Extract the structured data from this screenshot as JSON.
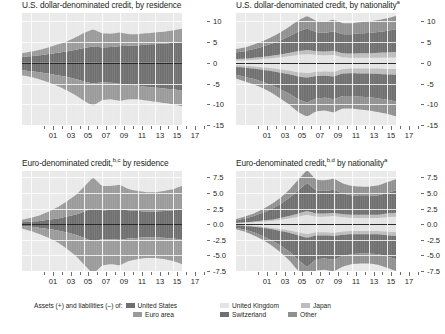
{
  "figure": {
    "panels": [
      {
        "id": "usd-by-residence",
        "title_main": "U.S. dollar-denominated credit, by residence",
        "title_pre": "U.S. dollar-denominated credit, by residence",
        "title_sup": "",
        "yticks": [
          "10",
          "5",
          "0",
          "-5",
          "-10",
          "-15"
        ],
        "xticks": [
          "01",
          "03",
          "05",
          "07",
          "09",
          "11",
          "13",
          "15",
          "17"
        ]
      },
      {
        "id": "usd-by-nationality",
        "title_main": "U.S. dollar-denominated credit, by nationality",
        "title_pre": "U.S. dollar-denominated credit, by nationality",
        "title_sup": "a",
        "yticks": [
          "10",
          "5",
          "0",
          "-5",
          "-10",
          "-15"
        ],
        "xticks": [
          "01",
          "03",
          "05",
          "07",
          "09",
          "11",
          "13",
          "15",
          "17"
        ]
      },
      {
        "id": "eur-by-residence",
        "title_main": "Euro-denominated credit, by residence",
        "title_pre": "Euro-denominated credit,",
        "title_sup": "b,c",
        "title_post": " by residence",
        "yticks": [
          "7.5",
          "5.0",
          "2.5",
          "0.0",
          "-2.5",
          "-5.0",
          "-7.5"
        ],
        "xticks": [
          "01",
          "03",
          "05",
          "07",
          "09",
          "11",
          "13",
          "15",
          "17"
        ]
      },
      {
        "id": "eur-by-nationality",
        "title_main": "Euro-denominated credit, by nationality",
        "title_pre": "Euro-denominated credit,",
        "title_sup": "b,d",
        "title_post": " by nationality",
        "title_sup2": "a",
        "yticks": [
          "7.5",
          "5.0",
          "2.5",
          "0.0",
          "-2.5",
          "-5.0",
          "-7.5"
        ],
        "xticks": [
          "01",
          "03",
          "05",
          "07",
          "09",
          "11",
          "13",
          "15",
          "17"
        ]
      }
    ]
  },
  "legend_left": {
    "prefix": "Assets (+) and liabilities (–) of:",
    "items": [
      {
        "label": "United States",
        "color": "#6f6f6f"
      },
      {
        "label": "Euro area",
        "color": "#9a9a9a"
      }
    ]
  },
  "legend_right": {
    "items": [
      {
        "label": "United Kingdom",
        "color": "#e4e4e4"
      },
      {
        "label": "Japan",
        "color": "#bdbdbd"
      },
      {
        "label": "Switzerland",
        "color": "#6f6f6f"
      },
      {
        "label": "Other",
        "color": "#909090"
      }
    ]
  },
  "colors": {
    "plot_background": "#e9e9e9",
    "grid": "#ffffff",
    "zero_line": "#2a2a2a",
    "band_united_states": "#6f6f6f",
    "band_euro_area": "#9a9a9a",
    "band_united_kingdom": "#e4e4e4",
    "band_japan": "#bdbdbd",
    "band_switzerland": "#6f6f6f",
    "band_other": "#909090",
    "text": "#231f20"
  },
  "chart_data": {
    "type": "area",
    "ylabel": "",
    "xlabel": "",
    "grid": true,
    "legend_position": "bottom",
    "panels": [
      {
        "title": "U.S. dollar-denominated credit, by residence",
        "ylim": [
          -15,
          12
        ],
        "yticks": [
          10,
          5,
          0,
          -5,
          -10,
          -15
        ],
        "x": [
          2000,
          2001,
          2002,
          2003,
          2004,
          2005,
          2006,
          2007,
          2008,
          2009,
          2010,
          2011,
          2012,
          2013,
          2014,
          2015,
          2016,
          2017,
          2018
        ],
        "xticklabels": [
          "01",
          "03",
          "05",
          "07",
          "09",
          "11",
          "13",
          "15",
          "17"
        ],
        "series": [
          {
            "name": "United States",
            "side": "positive",
            "values": [
              1.4,
              1.6,
              1.8,
              2.1,
              2.4,
              2.7,
              3.1,
              3.6,
              3.9,
              3.7,
              3.8,
              4.0,
              4.1,
              4.2,
              4.4,
              4.5,
              4.6,
              4.8,
              5.0
            ]
          },
          {
            "name": "Euro area",
            "side": "positive",
            "values": [
              0.9,
              1.1,
              1.3,
              1.6,
              2.0,
              2.4,
              3.0,
              3.6,
              4.2,
              3.4,
              3.2,
              3.3,
              2.8,
              2.7,
              2.7,
              2.8,
              2.9,
              3.0,
              3.2
            ]
          },
          {
            "name": "United States",
            "side": "negative",
            "values": [
              -1.8,
              -2.0,
              -2.3,
              -2.6,
              -3.0,
              -3.4,
              -3.9,
              -4.5,
              -5.0,
              -4.7,
              -4.8,
              -5.1,
              -5.3,
              -5.5,
              -5.8,
              -6.0,
              -6.2,
              -6.4,
              -6.7
            ]
          },
          {
            "name": "Euro area",
            "side": "negative",
            "values": [
              -1.2,
              -1.4,
              -1.7,
              -2.1,
              -2.6,
              -3.2,
              -3.9,
              -4.7,
              -5.4,
              -4.3,
              -4.0,
              -4.1,
              -3.5,
              -3.3,
              -3.3,
              -3.4,
              -3.5,
              -3.6,
              -3.8
            ]
          }
        ]
      },
      {
        "title": "U.S. dollar-denominated credit, by nationality",
        "ylim": [
          -15,
          12
        ],
        "yticks": [
          10,
          5,
          0,
          -5,
          -10,
          -15
        ],
        "x": [
          2000,
          2001,
          2002,
          2003,
          2004,
          2005,
          2006,
          2007,
          2008,
          2009,
          2010,
          2011,
          2012,
          2013,
          2014,
          2015,
          2016,
          2017,
          2018
        ],
        "xticklabels": [
          "01",
          "03",
          "05",
          "07",
          "09",
          "11",
          "13",
          "15",
          "17"
        ],
        "series": [
          {
            "name": "United Kingdom",
            "side": "positive",
            "values": [
              0.5,
              0.6,
              0.7,
              0.9,
              1.1,
              1.3,
              1.6,
              1.9,
              2.1,
              1.9,
              1.8,
              1.9,
              1.3,
              1.2,
              1.2,
              1.2,
              1.2,
              1.3,
              1.3
            ]
          },
          {
            "name": "Japan",
            "side": "positive",
            "values": [
              0.4,
              0.4,
              0.5,
              0.5,
              0.6,
              0.7,
              0.8,
              0.9,
              1.0,
              0.9,
              0.9,
              1.0,
              1.0,
              1.0,
              1.1,
              1.1,
              1.2,
              1.2,
              1.3
            ]
          },
          {
            "name": "Switzerland",
            "side": "positive",
            "values": [
              1.6,
              1.8,
              2.1,
              2.5,
              2.9,
              3.4,
              4.0,
              4.7,
              5.2,
              4.6,
              4.5,
              4.7,
              4.6,
              4.7,
              4.8,
              4.9,
              5.0,
              5.2,
              5.5
            ]
          },
          {
            "name": "Other",
            "side": "positive",
            "values": [
              0.8,
              0.9,
              1.1,
              1.3,
              1.6,
              1.9,
              2.3,
              2.7,
              3.0,
              2.7,
              2.7,
              2.8,
              2.6,
              2.6,
              2.7,
              2.8,
              2.9,
              3.0,
              3.2
            ]
          },
          {
            "name": "United Kingdom",
            "side": "negative",
            "values": [
              -0.6,
              -0.7,
              -0.9,
              -1.1,
              -1.3,
              -1.6,
              -1.9,
              -2.3,
              -2.5,
              -2.2,
              -2.1,
              -2.2,
              -1.5,
              -1.4,
              -1.4,
              -1.4,
              -1.4,
              -1.5,
              -1.5
            ]
          },
          {
            "name": "Japan",
            "side": "negative",
            "values": [
              -0.4,
              -0.5,
              -0.5,
              -0.6,
              -0.7,
              -0.8,
              -0.9,
              -1.0,
              -1.1,
              -1.0,
              -1.0,
              -1.1,
              -1.1,
              -1.1,
              -1.2,
              -1.2,
              -1.3,
              -1.3,
              -1.4
            ]
          },
          {
            "name": "Switzerland",
            "side": "negative",
            "values": [
              -1.9,
              -2.2,
              -2.5,
              -2.9,
              -3.4,
              -4.0,
              -4.7,
              -5.5,
              -6.0,
              -5.4,
              -5.3,
              -5.5,
              -5.4,
              -5.5,
              -5.6,
              -5.7,
              -5.9,
              -6.1,
              -6.4
            ]
          },
          {
            "name": "Other",
            "side": "negative",
            "values": [
              -0.9,
              -1.1,
              -1.3,
              -1.5,
              -1.8,
              -2.2,
              -2.6,
              -3.1,
              -3.4,
              -3.1,
              -3.1,
              -3.2,
              -3.0,
              -3.0,
              -3.1,
              -3.2,
              -3.3,
              -3.4,
              -3.6
            ]
          }
        ]
      },
      {
        "title": "Euro-denominated credit, by residence",
        "ylim": [
          -7.5,
          8.5
        ],
        "yticks": [
          7.5,
          5.0,
          2.5,
          0.0,
          -2.5,
          -5.0,
          -7.5
        ],
        "x": [
          2000,
          2001,
          2002,
          2003,
          2004,
          2005,
          2006,
          2007,
          2008,
          2009,
          2010,
          2011,
          2012,
          2013,
          2014,
          2015,
          2016,
          2017,
          2018
        ],
        "xticklabels": [
          "01",
          "03",
          "05",
          "07",
          "09",
          "11",
          "13",
          "15",
          "17"
        ],
        "series": [
          {
            "name": "United States",
            "side": "positive",
            "values": [
              0.3,
              0.4,
              0.5,
              0.7,
              0.9,
              1.2,
              1.5,
              2.0,
              2.6,
              2.2,
              2.3,
              2.4,
              2.2,
              2.1,
              2.0,
              2.0,
              2.1,
              2.2,
              2.4
            ]
          },
          {
            "name": "Euro area",
            "side": "positive",
            "values": [
              0.4,
              0.6,
              0.9,
              1.3,
              1.8,
              2.4,
              3.1,
              4.0,
              4.9,
              3.9,
              3.8,
              3.9,
              3.4,
              3.2,
              3.1,
              3.1,
              3.2,
              3.4,
              3.7
            ]
          },
          {
            "name": "United States",
            "side": "negative",
            "values": [
              -0.3,
              -0.4,
              -0.6,
              -0.8,
              -1.0,
              -1.3,
              -1.7,
              -2.2,
              -2.8,
              -2.4,
              -2.4,
              -2.5,
              -2.3,
              -2.2,
              -2.1,
              -2.1,
              -2.2,
              -2.3,
              -2.5
            ]
          },
          {
            "name": "Euro area",
            "side": "negative",
            "values": [
              -0.4,
              -0.7,
              -1.0,
              -1.4,
              -1.9,
              -2.6,
              -3.3,
              -4.3,
              -5.2,
              -4.2,
              -4.0,
              -4.1,
              -3.6,
              -3.4,
              -3.3,
              -3.3,
              -3.4,
              -3.6,
              -3.9
            ]
          }
        ]
      },
      {
        "title": "Euro-denominated credit, by nationality",
        "ylim": [
          -7.5,
          8.5
        ],
        "yticks": [
          7.5,
          5.0,
          2.5,
          0.0,
          -2.5,
          -5.0,
          -7.5
        ],
        "x": [
          2000,
          2001,
          2002,
          2003,
          2004,
          2005,
          2006,
          2007,
          2008,
          2009,
          2010,
          2011,
          2012,
          2013,
          2014,
          2015,
          2016,
          2017,
          2018
        ],
        "xticklabels": [
          "01",
          "03",
          "05",
          "07",
          "09",
          "11",
          "13",
          "15",
          "17"
        ],
        "series": [
          {
            "name": "United Kingdom",
            "side": "positive",
            "values": [
              0.1,
              0.2,
              0.3,
              0.4,
              0.5,
              0.7,
              0.9,
              1.2,
              1.5,
              1.2,
              1.2,
              1.3,
              1.1,
              1.0,
              1.0,
              1.0,
              1.0,
              1.1,
              1.2
            ]
          },
          {
            "name": "Japan",
            "side": "positive",
            "values": [
              0.1,
              0.1,
              0.1,
              0.2,
              0.2,
              0.3,
              0.4,
              0.5,
              0.6,
              0.5,
              0.5,
              0.5,
              0.5,
              0.5,
              0.5,
              0.5,
              0.5,
              0.6,
              0.6
            ]
          },
          {
            "name": "Switzerland",
            "side": "positive",
            "values": [
              0.4,
              0.6,
              0.9,
              1.2,
              1.7,
              2.2,
              2.9,
              3.7,
              4.5,
              3.7,
              3.6,
              3.7,
              3.3,
              3.1,
              3.0,
              3.0,
              3.1,
              3.3,
              3.6
            ]
          },
          {
            "name": "Other",
            "side": "positive",
            "values": [
              0.2,
              0.3,
              0.4,
              0.6,
              0.8,
              1.0,
              1.3,
              1.7,
              2.1,
              1.7,
              1.7,
              1.8,
              1.6,
              1.5,
              1.5,
              1.5,
              1.6,
              1.7,
              1.8
            ]
          },
          {
            "name": "United Kingdom",
            "side": "negative",
            "values": [
              -0.1,
              -0.2,
              -0.3,
              -0.4,
              -0.6,
              -0.8,
              -1.0,
              -1.3,
              -1.6,
              -1.3,
              -1.3,
              -1.4,
              -1.2,
              -1.1,
              -1.1,
              -1.1,
              -1.1,
              -1.2,
              -1.3
            ]
          },
          {
            "name": "Japan",
            "side": "negative",
            "values": [
              -0.1,
              -0.1,
              -0.1,
              -0.2,
              -0.2,
              -0.3,
              -0.4,
              -0.5,
              -0.6,
              -0.5,
              -0.5,
              -0.5,
              -0.5,
              -0.5,
              -0.5,
              -0.5,
              -0.5,
              -0.6,
              -0.6
            ]
          },
          {
            "name": "Switzerland",
            "side": "negative",
            "values": [
              -0.4,
              -0.6,
              -0.9,
              -1.3,
              -1.8,
              -2.3,
              -3.0,
              -3.9,
              -4.7,
              -3.8,
              -3.7,
              -3.8,
              -3.4,
              -3.2,
              -3.1,
              -3.1,
              -3.2,
              -3.4,
              -3.7
            ]
          },
          {
            "name": "Other",
            "side": "negative",
            "values": [
              -0.2,
              -0.3,
              -0.5,
              -0.6,
              -0.8,
              -1.1,
              -1.4,
              -1.8,
              -2.2,
              -1.8,
              -1.8,
              -1.9,
              -1.7,
              -1.6,
              -1.6,
              -1.6,
              -1.7,
              -1.8,
              -1.9
            ]
          }
        ]
      }
    ]
  }
}
